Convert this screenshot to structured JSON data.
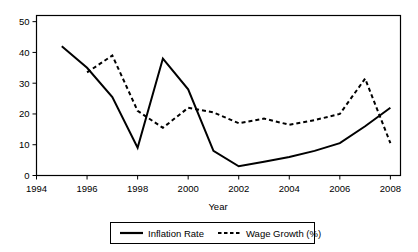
{
  "chart_data": {
    "type": "line",
    "title": "",
    "xlabel": "Year",
    "ylabel": "",
    "xlim": [
      1994,
      2008.4
    ],
    "ylim": [
      0,
      52
    ],
    "grid": false,
    "legend_position": "bottom",
    "xticks": [
      1994,
      1996,
      1998,
      2000,
      2002,
      2004,
      2006,
      2008
    ],
    "xtick_labels": [
      "1994",
      "1996",
      "1998",
      "2000",
      "2002",
      "2004",
      "2006",
      "2008"
    ],
    "yticks": [
      0,
      10,
      20,
      30,
      40,
      50
    ],
    "ytick_labels": [
      "0",
      "10",
      "20",
      "30",
      "40",
      "50"
    ],
    "series": [
      {
        "name": "Inflation Rate",
        "style": "solid",
        "color": "#000000",
        "x": [
          1995,
          1996,
          1997,
          1998,
          1999,
          2000,
          2001,
          2002,
          2003,
          2004,
          2005,
          2006,
          2007,
          2008
        ],
        "values": [
          42,
          35,
          25.5,
          9,
          38,
          28,
          8,
          3,
          4.5,
          6,
          8,
          10.5,
          16,
          22
        ]
      },
      {
        "name": "Wage Growth (%)",
        "style": "dashed",
        "color": "#000000",
        "x": [
          1996,
          1997,
          1998,
          1999,
          2000,
          2001,
          2002,
          2003,
          2004,
          2005,
          2006,
          2007,
          2008
        ],
        "values": [
          33.5,
          39,
          21,
          15.5,
          22,
          20.5,
          17,
          18.5,
          16.5,
          18,
          20,
          31.5,
          10.5
        ]
      }
    ]
  },
  "axes": {
    "x_axis_title": "Year"
  },
  "legend": {
    "entries": [
      {
        "label": "Inflation Rate",
        "style": "solid"
      },
      {
        "label": "Wage Growth (%)",
        "style": "dashed"
      }
    ]
  }
}
